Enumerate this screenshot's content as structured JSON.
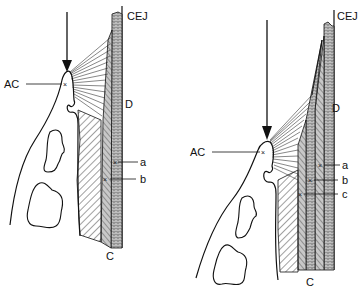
{
  "diagram": {
    "type": "anatomical-schematic",
    "colors": {
      "ink": "#111111",
      "background": "#ffffff",
      "stipple": "#bdbdbd"
    },
    "panels": [
      {
        "id": "left",
        "labels": {
          "cej": "CEJ",
          "ac": "AC",
          "d": "D",
          "a": "a",
          "b": "b",
          "c": "C"
        },
        "markers": [
          "a",
          "b"
        ],
        "arrow": "pointing-down-to-AC"
      },
      {
        "id": "right",
        "labels": {
          "cej": "CEJ",
          "ac": "AC",
          "d": "D",
          "a": "a",
          "b": "b",
          "c_lower": "c",
          "c": "C"
        },
        "markers": [
          "a",
          "b",
          "c"
        ],
        "arrow": "pointing-down-to-AC"
      }
    ]
  }
}
